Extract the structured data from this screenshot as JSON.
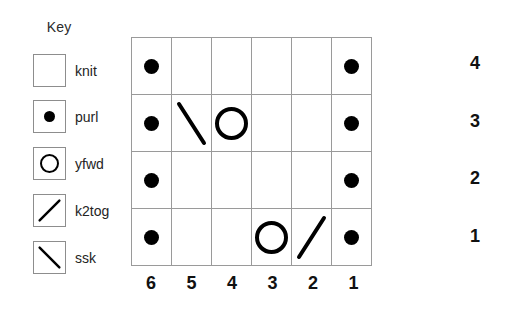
{
  "legend": {
    "title": "Key",
    "entries": [
      {
        "symbol": "knit",
        "label": "knit"
      },
      {
        "symbol": "purl",
        "label": "purl"
      },
      {
        "symbol": "yfwd",
        "label": "yfwd"
      },
      {
        "symbol": "k2tog",
        "label": "k2tog"
      },
      {
        "symbol": "ssk",
        "label": "ssk"
      }
    ]
  },
  "chart_data": {
    "type": "table",
    "title": "",
    "xlabel": "",
    "ylabel": "",
    "columns": 6,
    "rows": 4,
    "column_labels": [
      "6",
      "5",
      "4",
      "3",
      "2",
      "1"
    ],
    "row_labels": [
      "4",
      "3",
      "2",
      "1"
    ],
    "row_label_position": "right",
    "column_label_position": "bottom",
    "reading_direction": "right-to-left",
    "symbol_names": [
      "knit",
      "purl",
      "yfwd",
      "k2tog",
      "ssk"
    ],
    "grid": true,
    "grid_color": "#9a9a9a",
    "symbol_color": "#000000",
    "background_color": "#ffffff",
    "cells": [
      {
        "row_label": "4",
        "values": [
          "purl",
          "knit",
          "knit",
          "knit",
          "knit",
          "purl"
        ]
      },
      {
        "row_label": "3",
        "values": [
          "purl",
          "ssk",
          "yfwd",
          "knit",
          "knit",
          "purl"
        ]
      },
      {
        "row_label": "2",
        "values": [
          "purl",
          "knit",
          "knit",
          "knit",
          "knit",
          "purl"
        ]
      },
      {
        "row_label": "1",
        "values": [
          "purl",
          "knit",
          "knit",
          "yfwd",
          "k2tog",
          "purl"
        ]
      }
    ]
  }
}
